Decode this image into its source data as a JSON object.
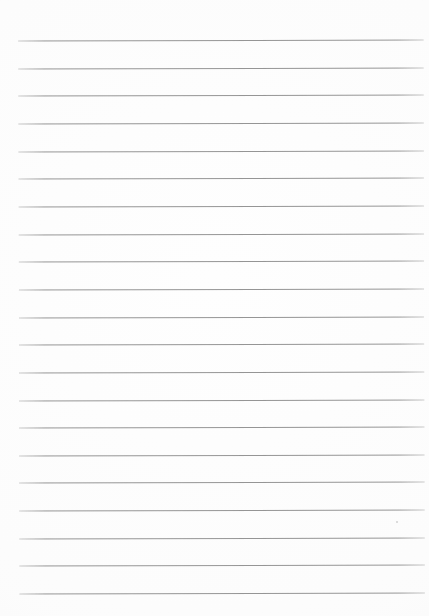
{
  "page": {
    "kind": "ruled-paper-sheet",
    "width": 429,
    "height": 616,
    "background_color": "#fefefe",
    "content_text": ""
  },
  "ruling": {
    "line_color": "#8d8d8d",
    "line_thickness": 1,
    "line_count": 21,
    "first_line_y": 40,
    "line_spacing": 27.65,
    "left_margin_x": 19,
    "right_margin_x": 424,
    "tilt_degrees": -0.13,
    "lines": [
      {
        "index": 1,
        "y": 40.0,
        "x1": 19,
        "x2": 424
      },
      {
        "index": 2,
        "y": 67.7,
        "x1": 19,
        "x2": 424
      },
      {
        "index": 3,
        "y": 95.3,
        "x1": 19,
        "x2": 424
      },
      {
        "index": 4,
        "y": 123.0,
        "x1": 19,
        "x2": 424
      },
      {
        "index": 5,
        "y": 150.6,
        "x1": 19,
        "x2": 424
      },
      {
        "index": 6,
        "y": 178.3,
        "x1": 19,
        "x2": 424
      },
      {
        "index": 7,
        "y": 205.9,
        "x1": 19,
        "x2": 424
      },
      {
        "index": 8,
        "y": 233.6,
        "x1": 19,
        "x2": 424
      },
      {
        "index": 9,
        "y": 261.2,
        "x1": 19,
        "x2": 424
      },
      {
        "index": 10,
        "y": 288.9,
        "x1": 19,
        "x2": 424
      },
      {
        "index": 11,
        "y": 316.5,
        "x1": 19,
        "x2": 424
      },
      {
        "index": 12,
        "y": 344.2,
        "x1": 19,
        "x2": 424
      },
      {
        "index": 13,
        "y": 371.8,
        "x1": 19,
        "x2": 424
      },
      {
        "index": 14,
        "y": 399.5,
        "x1": 19,
        "x2": 424
      },
      {
        "index": 15,
        "y": 427.1,
        "x1": 19,
        "x2": 424
      },
      {
        "index": 16,
        "y": 454.8,
        "x1": 19,
        "x2": 424
      },
      {
        "index": 17,
        "y": 482.4,
        "x1": 19,
        "x2": 424
      },
      {
        "index": 18,
        "y": 510.1,
        "x1": 19,
        "x2": 424
      },
      {
        "index": 19,
        "y": 537.7,
        "x1": 19,
        "x2": 424
      },
      {
        "index": 20,
        "y": 565.4,
        "x1": 19,
        "x2": 424
      },
      {
        "index": 21,
        "y": 593.0,
        "x1": 19,
        "x2": 424
      }
    ]
  },
  "marks": [
    {
      "name": "paper-speck",
      "x": 396,
      "y": 521,
      "size": 2,
      "color": "#c9c9c9"
    }
  ]
}
